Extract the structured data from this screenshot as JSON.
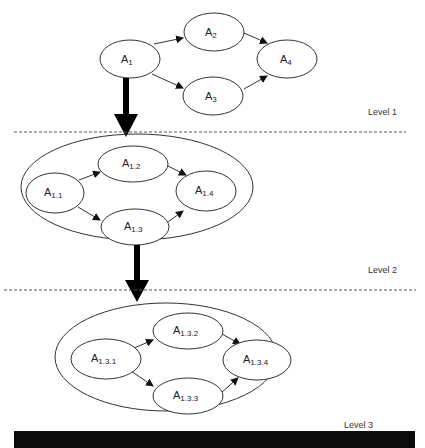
{
  "diagram": {
    "type": "hierarchical-activity-decomposition",
    "levels": [
      {
        "label": "Level 1",
        "nodes": [
          {
            "id": "A1",
            "base": "A",
            "sub": "1"
          },
          {
            "id": "A2",
            "base": "A",
            "sub": "2"
          },
          {
            "id": "A3",
            "base": "A",
            "sub": "3"
          },
          {
            "id": "A4",
            "base": "A",
            "sub": "4"
          }
        ],
        "edges": [
          [
            "A1",
            "A2"
          ],
          [
            "A1",
            "A3"
          ],
          [
            "A2",
            "A4"
          ],
          [
            "A3",
            "A4"
          ]
        ]
      },
      {
        "label": "Level 2",
        "expands": "A1",
        "nodes": [
          {
            "id": "A1.1",
            "base": "A",
            "sub": "1.1"
          },
          {
            "id": "A1.2",
            "base": "A",
            "sub": "1.2"
          },
          {
            "id": "A1.3",
            "base": "A",
            "sub": "1.3"
          },
          {
            "id": "A1.4",
            "base": "A",
            "sub": "1.4"
          }
        ],
        "edges": [
          [
            "A1.1",
            "A1.2"
          ],
          [
            "A1.1",
            "A1.3"
          ],
          [
            "A1.2",
            "A1.4"
          ],
          [
            "A1.3",
            "A1.4"
          ]
        ]
      },
      {
        "label": "Level 3",
        "expands": "A1.3",
        "nodes": [
          {
            "id": "A1.3.1",
            "base": "A",
            "sub": "1.3.1"
          },
          {
            "id": "A1.3.2",
            "base": "A",
            "sub": "1.3.2"
          },
          {
            "id": "A1.3.3",
            "base": "A",
            "sub": "1.3.3"
          },
          {
            "id": "A1.3.4",
            "base": "A",
            "sub": "1.3.4"
          }
        ],
        "edges": [
          [
            "A1.3.1",
            "A1.3.2"
          ],
          [
            "A1.3.1",
            "A1.3.3"
          ],
          [
            "A1.3.2",
            "A1.3.4"
          ],
          [
            "A1.3.3",
            "A1.3.4"
          ]
        ]
      }
    ]
  },
  "colors": {
    "stroke": "#333333",
    "arrow": "#000000",
    "background": "#ffffff",
    "bar": "#0c0c0c"
  }
}
